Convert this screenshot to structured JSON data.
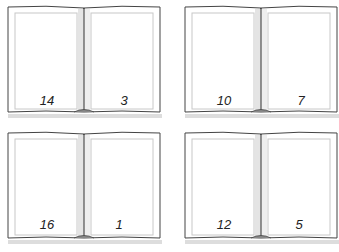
{
  "books": [
    {
      "left_page": "14",
      "right_page": "3"
    },
    {
      "left_page": "10",
      "right_page": "7"
    },
    {
      "left_page": "16",
      "right_page": "1"
    },
    {
      "left_page": "12",
      "right_page": "5"
    }
  ]
}
